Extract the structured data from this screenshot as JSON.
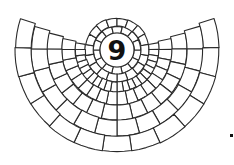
{
  "figure": {
    "label": "9",
    "center": [
      117,
      50
    ],
    "colors": {
      "stroke": "#2a2a2a",
      "fill": "#ffffff",
      "label": "#111111"
    },
    "rings": [
      {
        "r0": 17,
        "r1": 24,
        "n": 14,
        "a0": 0,
        "a1": 360
      },
      {
        "r0": 24,
        "r1": 32,
        "n": 18,
        "a0": 0,
        "a1": 360
      },
      {
        "r0": 32,
        "r1": 42,
        "n": 22,
        "a0": -10,
        "a1": 190
      },
      {
        "r0": 42,
        "r1": 55,
        "n": 18,
        "a0": -12,
        "a1": 192
      },
      {
        "r0": 55,
        "r1": 70,
        "n": 16,
        "a0": -14,
        "a1": 194
      },
      {
        "r0": 70,
        "r1": 86,
        "n": 14,
        "a0": -16,
        "a1": 196
      },
      {
        "r0": 86,
        "r1": 102,
        "n": 13,
        "a0": -18,
        "a1": 198
      }
    ],
    "marker": {
      "x": 230,
      "y": 134,
      "size": 3
    }
  }
}
